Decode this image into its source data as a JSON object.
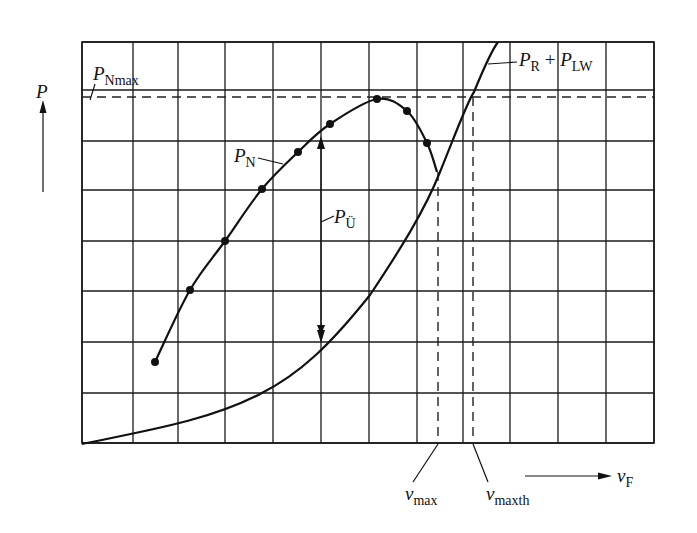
{
  "diagram": {
    "grid": {
      "x_lines": [
        82,
        133,
        178,
        225,
        273,
        321,
        369,
        417,
        463,
        510,
        558,
        606,
        654
      ],
      "y_lines": [
        42,
        90,
        141,
        190,
        241,
        291,
        342,
        393,
        443
      ]
    },
    "axes": {
      "y_axis_label": "P",
      "x_axis_label": "v",
      "x_axis_sub": "F"
    },
    "labels": {
      "p_nmax": {
        "main": "P",
        "sub": "Nmax"
      },
      "p_n": {
        "main": "P",
        "sub": "N"
      },
      "p_u": {
        "main": "P",
        "sub": "Ü"
      },
      "p_r_lw": {
        "main1": "P",
        "sub1": "R",
        "plus": " + ",
        "main2": "P",
        "sub2": "LW"
      },
      "v_max": {
        "main": "v",
        "sub": "max"
      },
      "v_maxth": {
        "main": "v",
        "sub": "maxth"
      }
    },
    "curves": {
      "p_n_points": [
        [
          155,
          362
        ],
        [
          190,
          290
        ],
        [
          225,
          241
        ],
        [
          262,
          189
        ],
        [
          298,
          152
        ],
        [
          330,
          124
        ],
        [
          377,
          99
        ],
        [
          407,
          111
        ],
        [
          427,
          143
        ]
      ],
      "p_n_end": [
        437,
        172
      ],
      "p_r_lw_path": "M82,444 C150,430 210,420 260,394 C300,374 330,345 370,295 C400,250 425,210 440,172 C455,135 468,100 474,92 C483,70 492,50 498,42"
    },
    "markers": {
      "p_nmax_y": 97,
      "v_max_x": 438,
      "v_maxth_x": 473,
      "p_u_arrow_x": 321
    },
    "colors": {
      "ink": "#111111",
      "background": "#ffffff"
    }
  }
}
